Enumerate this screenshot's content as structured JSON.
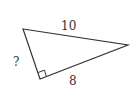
{
  "diagram": {
    "type": "right-triangle",
    "vertices": {
      "top_left": [
        23,
        29
      ],
      "right_angle": [
        40,
        79
      ],
      "right": [
        128,
        45
      ]
    },
    "labels": {
      "hypotenuse": "10",
      "unknown_leg": "?",
      "known_leg": "8"
    },
    "right_angle_marker": true,
    "stroke_color": "#333333"
  }
}
